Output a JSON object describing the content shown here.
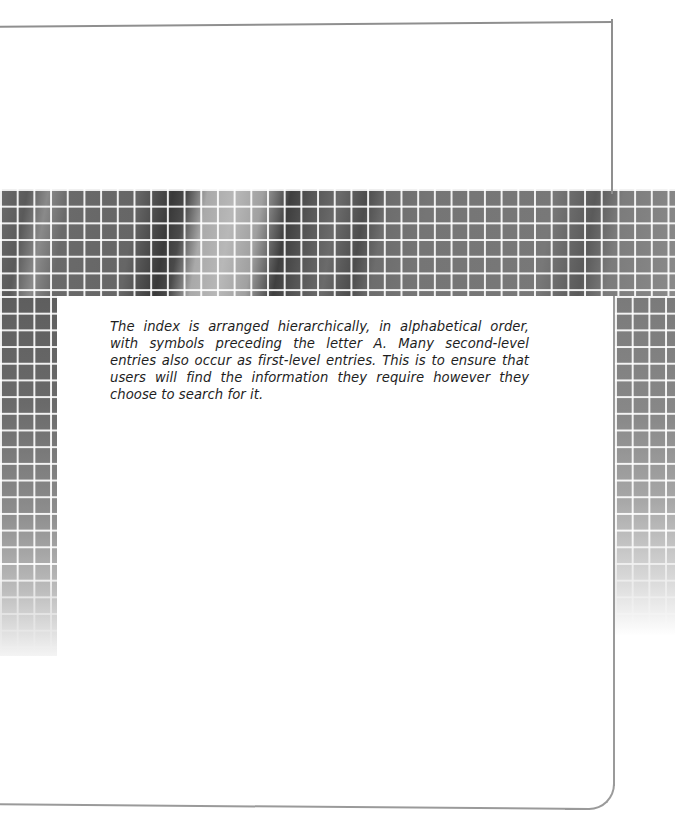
{
  "page": {
    "intro_paragraph": "The index is arranged hierarchically, in alphabetical order, with symbols preceding the letter A. Many second-level entries also occur as first-level entries. This is to ensure that users will find the information they require however they choose to search for it."
  },
  "decoration": {
    "band": "grayscale-photo-with-white-grid",
    "frame_color": "#8f8f8f",
    "text_color": "#1e1e1e"
  }
}
